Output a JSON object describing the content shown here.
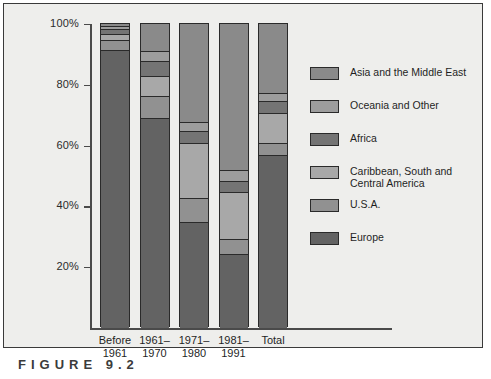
{
  "figure": {
    "caption": "FIGURE 9.2"
  },
  "axis": {
    "y_ticks": [
      "100%",
      "80%",
      "60%",
      "40%",
      "20%"
    ]
  },
  "legend": {
    "position": "right",
    "items": [
      {
        "label": "Asia and the Middle East",
        "color": "#8a8a8a"
      },
      {
        "label": "Oceania and Other",
        "color": "#9d9d9d"
      },
      {
        "label": "Africa",
        "color": "#747474"
      },
      {
        "label": "Caribbean, South and\nCentral America",
        "color": "#a8a8a8"
      },
      {
        "label": "U.S.A.",
        "color": "#919191"
      },
      {
        "label": "Europe",
        "color": "#636363"
      }
    ]
  },
  "chart_data": {
    "type": "bar",
    "subtype": "stacked-100-percent",
    "title": "",
    "xlabel": "",
    "ylabel": "",
    "ylim": [
      0,
      100
    ],
    "grid": false,
    "categories": [
      "Before\n1961",
      "1961–\n1970",
      "1971–\n1980",
      "1981–\n1991",
      "Total"
    ],
    "category_lines": [
      [
        "Before",
        "1961"
      ],
      [
        "1961–",
        "1970"
      ],
      [
        "1971–",
        "1980"
      ],
      [
        "1981–",
        "1991"
      ],
      [
        "Total",
        ""
      ]
    ],
    "series": [
      {
        "name": "Europe",
        "color": "#636363",
        "values": [
          91.0,
          68.8,
          34.5,
          24.0,
          56.5
        ]
      },
      {
        "name": "U.S.A.",
        "color": "#919191",
        "values": [
          3.5,
          7.2,
          8.0,
          4.8,
          4.0
        ]
      },
      {
        "name": "Caribbean, South and Central America",
        "color": "#a8a8a8",
        "values": [
          2.0,
          6.7,
          18.0,
          15.7,
          10.0
        ]
      },
      {
        "name": "Africa",
        "color": "#747474",
        "values": [
          1.5,
          4.9,
          4.0,
          3.5,
          4.0
        ]
      },
      {
        "name": "Oceania and Other",
        "color": "#9d9d9d",
        "values": [
          1.0,
          3.1,
          3.0,
          3.5,
          2.5
        ]
      },
      {
        "name": "Asia and the Middle East",
        "color": "#8a8a8a",
        "values": [
          1.0,
          9.3,
          32.5,
          48.5,
          23.0
        ]
      }
    ]
  }
}
